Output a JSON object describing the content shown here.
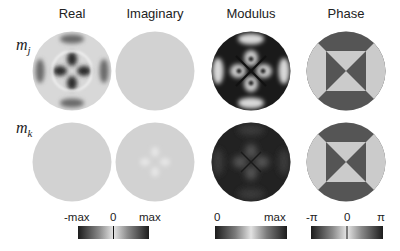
{
  "figure": {
    "columns": [
      {
        "label": "Real"
      },
      {
        "label": "Imaginary"
      },
      {
        "label": "Modulus"
      },
      {
        "label": "Phase"
      }
    ],
    "rows": [
      {
        "label": "m",
        "sub": "j"
      },
      {
        "label": "m",
        "sub": "k"
      }
    ],
    "colorbars": [
      {
        "name": "real-imaginary",
        "labels": [
          "-max",
          "0",
          "max"
        ]
      },
      {
        "name": "modulus",
        "labels": [
          "0",
          "max"
        ]
      },
      {
        "name": "phase",
        "labels": [
          "-π",
          "0",
          "π"
        ]
      }
    ],
    "colors": {
      "background": "#ffffff",
      "neutral_gray": "#cfcfcf",
      "dark": "#1a1a1a",
      "phase_dark": "#555555",
      "phase_light": "#cccccc"
    }
  }
}
